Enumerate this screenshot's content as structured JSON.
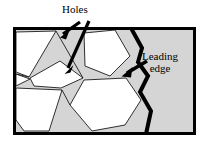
{
  "figure": {
    "type": "technical-diagram",
    "canvas": {
      "width": 208,
      "height": 146
    },
    "colors": {
      "background": "#ffffff",
      "sheet_fill": "#d5d5d5",
      "hole_fill": "#ffffff",
      "outline": "#000000",
      "thin_line": "#1a1a1a",
      "leading_edge": "#000000"
    },
    "frame": {
      "name": "sheet-frame",
      "x": 13,
      "y": 27,
      "width": 183,
      "height": 108,
      "border_width": 3
    },
    "leading_edge": {
      "name": "leading-edge-path",
      "stroke_width": 4,
      "points": "131,28 142,48 138,62 148,76 140,92 151,111 146,134"
    },
    "holes": [
      {
        "name": "hole-triangle-upper-left",
        "points": "16,32 56,31 29,77 16,72"
      },
      {
        "name": "hole-sliver-left",
        "points": "16,74 30,79 16,86"
      },
      {
        "name": "hole-wedge-mid",
        "points": "30,78 60,61 83,78 61,88 34,86"
      },
      {
        "name": "hole-triangle-lower-left",
        "points": "16,88 62,90 49,131 24,131 16,120"
      },
      {
        "name": "hole-pentagon-upper",
        "points": "84,33 115,30 130,56 110,76 85,66"
      },
      {
        "name": "hole-hexagon-lower",
        "points": "84,80 126,78 141,100 125,125 92,131 70,105"
      }
    ],
    "thin_edges": [
      "16,32 56,31",
      "56,31 29,77",
      "29,77 16,72",
      "16,74 30,79",
      "30,79 16,86",
      "30,78 60,61",
      "60,61 83,78",
      "83,78 61,88",
      "61,88 34,86",
      "34,86 30,78",
      "16,88 62,90",
      "62,90 49,131",
      "49,131 24,131",
      "24,131 16,120",
      "84,33 115,30",
      "115,30 130,56",
      "130,56 110,76",
      "110,76 85,66",
      "85,66 84,33",
      "84,80 126,78",
      "126,78 141,100",
      "141,100 125,125",
      "125,125 92,131",
      "92,131 70,105",
      "70,105 84,80",
      "56,31 83,78",
      "62,90 70,105"
    ],
    "annotations": [
      {
        "name": "annotation-holes",
        "label": "Holes",
        "label_x": 62,
        "label_y": 4,
        "arrows": [
          {
            "name": "holes-arrow-short",
            "tail_x": 80,
            "tail_y": 22,
            "head_x": 60,
            "head_y": 37,
            "shaft_width": 3.2,
            "head_size": 7
          },
          {
            "name": "holes-arrow-long",
            "tail_x": 89,
            "tail_y": 22,
            "head_x": 65,
            "head_y": 73,
            "shaft_width": 3.2,
            "head_size": 7
          }
        ]
      },
      {
        "name": "annotation-leading-edge",
        "label_line1": "Leading",
        "label_line2": "edge",
        "label_x": 142,
        "label_y": 50,
        "arrows": [
          {
            "name": "leading-edge-arrow",
            "tail_x": 146,
            "tail_y": 62,
            "head_x": 122,
            "head_y": 76,
            "shaft_width": 3.4,
            "head_size": 8
          }
        ]
      }
    ]
  }
}
